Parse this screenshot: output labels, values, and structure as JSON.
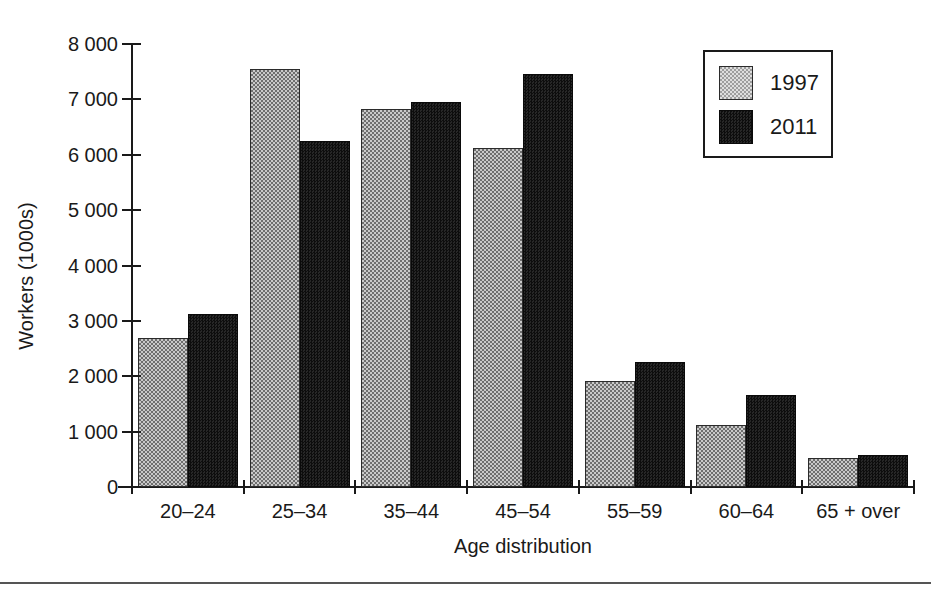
{
  "chart_data": {
    "type": "bar",
    "title": "",
    "xlabel": "Age distribution",
    "ylabel": "Workers (1000s)",
    "categories": [
      "20–24",
      "25–34",
      "35–44",
      "45–54",
      "55–59",
      "60–64",
      "65 + over"
    ],
    "series": [
      {
        "name": "1997",
        "color": "#9a9a9a",
        "values": [
          2700,
          7550,
          6820,
          6130,
          1910,
          1120,
          520
        ]
      },
      {
        "name": "2011",
        "color": "#161616",
        "values": [
          3120,
          6240,
          6960,
          7450,
          2260,
          1660,
          580
        ]
      }
    ],
    "ylim": [
      0,
      8000
    ],
    "yticks": [
      0,
      1000,
      2000,
      3000,
      4000,
      5000,
      6000,
      7000,
      8000
    ],
    "ytick_labels": [
      "0",
      "1 000",
      "2 000",
      "3 000",
      "4 000",
      "5 000",
      "6 000",
      "7 000",
      "8 000"
    ],
    "grid": false,
    "legend_position": "top-right"
  }
}
